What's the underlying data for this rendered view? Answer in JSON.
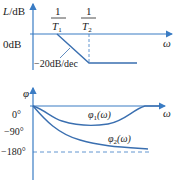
{
  "magnitude_plot": {
    "y_axis_label": "L/dB",
    "x_axis_label": "ω",
    "zero_label": "0dB",
    "corner1_num": "1",
    "corner1_den": "T",
    "corner1_sub": "1",
    "corner2_num": "1",
    "corner2_den": "T",
    "corner2_sub": "2",
    "slope_label": "−20dB/dec"
  },
  "phase_plot": {
    "y_axis_label": "φ",
    "x_axis_label": "ω",
    "tick_0": "0°",
    "tick_90": "−90°",
    "tick_180": "−180°",
    "curve1_label_main": "φ",
    "curve1_label_sub": "1",
    "curve1_label_arg": "(ω)",
    "curve2_label_main": "φ",
    "curve2_label_sub": "2",
    "curve2_label_arg": "(ω)"
  },
  "colors": {
    "axis": "#3a7cc4",
    "curve": "#3a6fb0",
    "text": "#222222"
  }
}
